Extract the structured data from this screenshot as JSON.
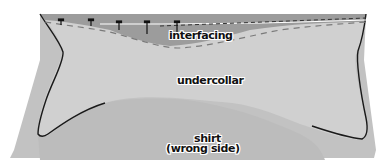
{
  "diagram": {
    "labels": {
      "interfacing": "interfacing",
      "undercollar": "undercollar",
      "shirt_line1": "shirt",
      "shirt_line2": "(wrong side)"
    },
    "colors": {
      "background": "#ffffff",
      "shirt": "#bdbdbd",
      "undercollar": "#cfcfcf",
      "interfacing": "#9a9a9a",
      "outline": "#1a1a1a",
      "stitch_dash": "#7a7a7a",
      "pins": "#111111"
    },
    "pins_count": 6
  }
}
